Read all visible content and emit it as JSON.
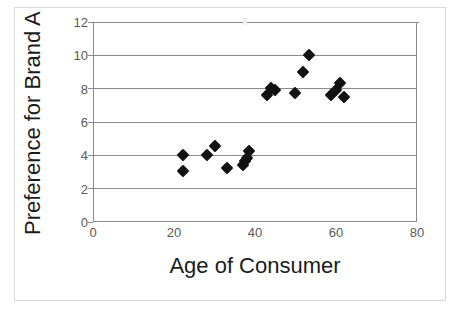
{
  "chart_data": {
    "type": "scatter",
    "title": "",
    "xlabel": "Age of Consumer",
    "ylabel": "Preference for Brand A",
    "xlim": [
      0,
      80
    ],
    "ylim": [
      0,
      12
    ],
    "xticks": [
      0,
      20,
      40,
      60,
      80
    ],
    "yticks": [
      0,
      2,
      4,
      6,
      8,
      10,
      12
    ],
    "xtick_labels": [
      "0",
      "20",
      "40",
      "60",
      "80"
    ],
    "ytick_labels": [
      "0",
      "2",
      "4",
      "6",
      "8",
      "10",
      "12"
    ],
    "grid": "horizontal",
    "legend": "none",
    "marker": "diamond",
    "marker_color": "#121212",
    "series": [
      {
        "name": "Consumers",
        "points": [
          {
            "x": 22.0,
            "y": 4.0
          },
          {
            "x": 22.0,
            "y": 3.0
          },
          {
            "x": 28.0,
            "y": 4.0
          },
          {
            "x": 30.0,
            "y": 4.5
          },
          {
            "x": 33.0,
            "y": 3.2
          },
          {
            "x": 37.0,
            "y": 3.4
          },
          {
            "x": 37.5,
            "y": 3.6
          },
          {
            "x": 38.0,
            "y": 3.8
          },
          {
            "x": 38.5,
            "y": 4.2
          },
          {
            "x": 43.0,
            "y": 7.6
          },
          {
            "x": 44.0,
            "y": 8.0
          },
          {
            "x": 45.0,
            "y": 7.9
          },
          {
            "x": 50.0,
            "y": 7.7
          },
          {
            "x": 52.0,
            "y": 9.0
          },
          {
            "x": 53.5,
            "y": 10.0
          },
          {
            "x": 59.0,
            "y": 7.6
          },
          {
            "x": 60.0,
            "y": 7.9
          },
          {
            "x": 61.0,
            "y": 8.3
          },
          {
            "x": 62.0,
            "y": 7.5
          }
        ]
      }
    ]
  },
  "axes": {
    "x_title": "Age of Consumer",
    "y_title": "Preference for Brand A"
  }
}
